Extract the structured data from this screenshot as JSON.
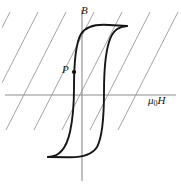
{
  "figure": {
    "kind": "magnetic-hysteresis-loop-diagram",
    "background_color": "#ffffff",
    "labels": {
      "vertical_axis": "B",
      "horizontal_axis_mu": "μ",
      "horizontal_axis_sub": "0",
      "horizontal_axis_field": "H",
      "point": "P"
    },
    "colors": {
      "curve": "#161616",
      "axis": "#8c8c8c",
      "load_line": "#9a9a9a",
      "marker": "#111111"
    },
    "axes": {
      "horizontal": {
        "x1": 5,
        "y1": 95,
        "x2": 176,
        "y2": 95
      },
      "vertical": {
        "x1": 82,
        "y1": 10,
        "x2": 82,
        "y2": 181
      }
    },
    "point_marker": {
      "x": 74,
      "y": 72,
      "r": 2.1
    },
    "load_lines": {
      "count": 8,
      "slope_note": "diagonal lines descending left-to-right, upper-right to lower-left",
      "dx": -60,
      "dy": 118,
      "spacing": 28,
      "start_x_top": -18
    },
    "curve": {
      "upper_branch_path": "M 48 157 C 58 157 66 150 70 132 C 73 118 74 104 74 88 C 74 64 75 44 81 34 C 86 26 96 24 109 25 C 117 25.4 123 25.8 127 26",
      "lower_branch_path": "M 127 26 C 120 26.6 113 29 109 42 C 105 55 104 72 104 92 C 104 116 103 136 97 147 C 92 155 82 157.6 68 157.2 C 58 157 52 157 48 157",
      "top_plateau_y": 26,
      "bottom_plateau_y": 157,
      "left_branch_x": 74,
      "right_branch_x": 104,
      "left_extent_x": 48,
      "right_extent_x": 127
    }
  }
}
